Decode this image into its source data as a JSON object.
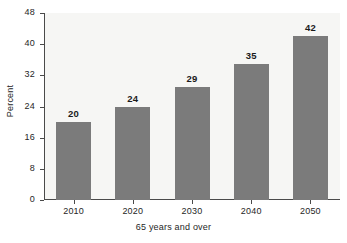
{
  "chart_data": {
    "type": "bar",
    "title": "",
    "subtitle": "",
    "categories": [
      "2010",
      "2020",
      "2030",
      "2040",
      "2050"
    ],
    "values": [
      20,
      24,
      29,
      35,
      42
    ],
    "data_labels": [
      "20",
      "24",
      "29",
      "35",
      "42"
    ],
    "xlabel": "65 years and over",
    "ylabel": "Percent",
    "ylim": [
      0,
      48
    ],
    "yticks": [
      0,
      8,
      16,
      24,
      32,
      40,
      48
    ],
    "ytick_labels": [
      "0",
      "8",
      "16",
      "24",
      "32",
      "40",
      "48"
    ],
    "grid": false,
    "legend": false,
    "legend_position": "none",
    "series": [
      {
        "name": "Percent",
        "values": [
          20,
          24,
          29,
          35,
          42
        ]
      }
    ],
    "colors": {
      "bar": "#7b7b7b",
      "plot_background": "#f6f6f4",
      "figure_background": "#ffffff",
      "axis": "#4a4a4a",
      "text": "#262626",
      "data_label": "#1a1a1a"
    }
  }
}
